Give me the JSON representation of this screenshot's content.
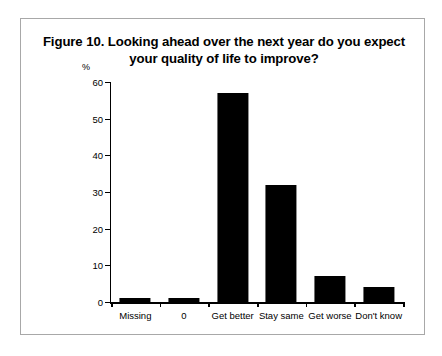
{
  "figure": {
    "title": "Figure 10. Looking ahead over the next year do you expect your quality of life to improve?",
    "unit_label": "%",
    "border_color": "#a8a8a8",
    "bar_color": "#000000",
    "background": "#ffffff"
  },
  "chart_data": {
    "type": "bar",
    "title": "Figure 10. Looking ahead over the next year do you expect your quality of life to improve?",
    "xlabel": "",
    "ylabel": "%",
    "ylim": [
      0,
      60
    ],
    "yticks": [
      0,
      10,
      20,
      30,
      40,
      50,
      60
    ],
    "grid": false,
    "legend": "none",
    "categories": [
      "Missing",
      "0",
      "Get better",
      "Stay same",
      "Get worse",
      "Don't know"
    ],
    "values": [
      1,
      1,
      57,
      32,
      7,
      4
    ]
  }
}
